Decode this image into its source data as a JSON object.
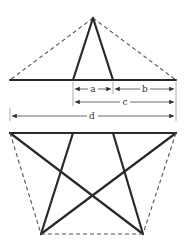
{
  "diagram": {
    "labels": {
      "a": "a",
      "b": "b",
      "c": "c",
      "d": "d"
    },
    "colors": {
      "stroke": "#2a2a2a",
      "dashed": "#555555",
      "background": "#ffffff"
    }
  }
}
